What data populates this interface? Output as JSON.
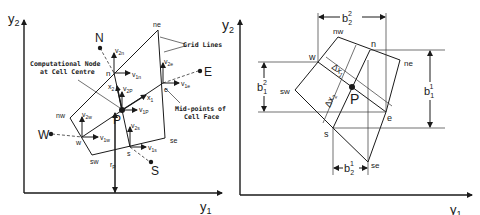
{
  "left_diagram": {
    "axes": {
      "y_axis": "y",
      "y_axis_sub": "2",
      "x_axis": "y",
      "x_axis_sub": "1"
    },
    "nodes": {
      "N": "N",
      "E": "E",
      "W": "W",
      "S": "S",
      "P": "P"
    },
    "corners": {
      "ne": "ne",
      "nw": "nw",
      "sw": "sw",
      "se": "se"
    },
    "faces": {
      "n": "n",
      "e": "e",
      "w": "w",
      "s": "s"
    },
    "velocities": {
      "v2n": {
        "base": "v",
        "sub": "2n"
      },
      "v1n": {
        "base": "v",
        "sub": "1n"
      },
      "v2e": {
        "base": "v",
        "sub": "2e"
      },
      "v1e": {
        "base": "v",
        "sub": "1e"
      },
      "v2p": {
        "base": "v",
        "sub": "2P"
      },
      "v1p": {
        "base": "v",
        "sub": "1P"
      },
      "v2w": {
        "base": "v",
        "sub": "2w"
      },
      "v1w": {
        "base": "v",
        "sub": "1w"
      },
      "v2s": {
        "base": "v",
        "sub": "2s"
      },
      "v1s": {
        "base": "v",
        "sub": "1s"
      }
    },
    "local_axes": {
      "x1": {
        "base": "x",
        "sub": "1"
      },
      "x2": {
        "base": "x",
        "sub": "2"
      }
    },
    "radius": {
      "base": "r",
      "sub": "P"
    },
    "annotations": {
      "grid_lines": "Grid Lines",
      "comp_node_1": "Computational Node",
      "comp_node_2": "at Cell Centre",
      "mid_points_1": "Mid-points of",
      "mid_points_2": "Cell Face"
    }
  },
  "right_diagram": {
    "axes": {
      "y_axis": "y",
      "y_axis_sub": "2",
      "x_axis": "y",
      "x_axis_sub": "1"
    },
    "corners": {
      "nw": "nw",
      "ne": "ne",
      "sw": "sw",
      "se": "se"
    },
    "faces": {
      "n": "n",
      "w": "w",
      "e": "e",
      "s": "s"
    },
    "centre": "P",
    "deltas": {
      "dx1": {
        "base": "Δx",
        "sub": "1"
      },
      "dx2": {
        "base": "Δx",
        "sub": "2"
      }
    },
    "dimensions": {
      "b22": {
        "base": "b",
        "sub": "2",
        "sup": "2"
      },
      "b12": {
        "base": "b",
        "sub": "1",
        "sup": "2"
      },
      "b11": {
        "base": "b",
        "sub": "1",
        "sup": "1"
      },
      "b21": {
        "base": "b",
        "sub": "2",
        "sup": "1"
      }
    }
  }
}
